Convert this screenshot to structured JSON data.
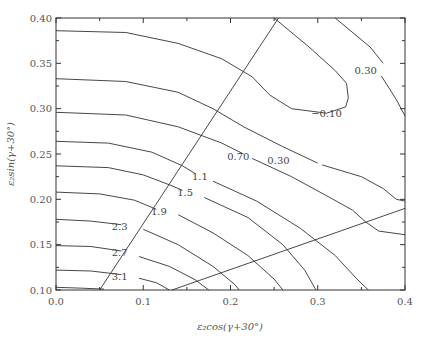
{
  "chart_data": {
    "type": "contour",
    "title": "",
    "xlabel": "ε₂cos(γ+30°)",
    "ylabel": "ε₂sin(γ+30°)",
    "xlim": [
      0.0,
      0.4
    ],
    "ylim": [
      0.1,
      0.4
    ],
    "xticks": [
      0.0,
      0.1,
      0.2,
      0.3,
      0.4
    ],
    "xtick_labels": [
      "0.0",
      "0.1",
      "0.2",
      "0.3",
      "0.4"
    ],
    "yticks": [
      0.1,
      0.15,
      0.2,
      0.25,
      0.3,
      0.35,
      0.4
    ],
    "ytick_labels": [
      "0.10",
      "0.15",
      "0.20",
      "0.25",
      "0.30",
      "0.35",
      "0.40"
    ],
    "grid": false,
    "contours": [
      {
        "level": "-0.10",
        "points": [
          [
            0.0,
            0.386
          ],
          [
            0.08,
            0.384
          ],
          [
            0.14,
            0.372
          ],
          [
            0.19,
            0.355
          ],
          [
            0.225,
            0.335
          ],
          [
            0.245,
            0.315
          ],
          [
            0.27,
            0.3
          ],
          [
            0.31,
            0.295
          ]
        ]
      },
      {
        "level": "-0.10b",
        "points": [
          [
            0.25,
            0.4
          ],
          [
            0.29,
            0.368
          ],
          [
            0.32,
            0.342
          ],
          [
            0.333,
            0.328
          ],
          [
            0.335,
            0.312
          ],
          [
            0.332,
            0.302
          ],
          [
            0.31,
            0.295
          ]
        ]
      },
      {
        "level": "0.30",
        "points": [
          [
            0.0,
            0.333
          ],
          [
            0.08,
            0.33
          ],
          [
            0.14,
            0.318
          ],
          [
            0.18,
            0.3
          ],
          [
            0.215,
            0.28
          ],
          [
            0.26,
            0.258
          ],
          [
            0.3,
            0.24
          ]
        ]
      },
      {
        "level": "0.30b",
        "points": [
          [
            0.305,
            0.238
          ],
          [
            0.35,
            0.225
          ],
          [
            0.375,
            0.212
          ],
          [
            0.39,
            0.2
          ],
          [
            0.4,
            0.198
          ]
        ]
      },
      {
        "level": "0.30c",
        "points": [
          [
            0.32,
            0.4
          ],
          [
            0.36,
            0.368
          ],
          [
            0.375,
            0.35
          ]
        ]
      },
      {
        "level": "0.30d",
        "points": [
          [
            0.373,
            0.336
          ],
          [
            0.39,
            0.31
          ],
          [
            0.4,
            0.292
          ]
        ]
      },
      {
        "level": "0.70",
        "points": [
          [
            0.0,
            0.296
          ],
          [
            0.08,
            0.293
          ],
          [
            0.14,
            0.28
          ],
          [
            0.19,
            0.262
          ],
          [
            0.215,
            0.25
          ]
        ]
      },
      {
        "level": "0.70b",
        "points": [
          [
            0.225,
            0.245
          ],
          [
            0.27,
            0.225
          ],
          [
            0.31,
            0.204
          ],
          [
            0.34,
            0.188
          ],
          [
            0.355,
            0.175
          ],
          [
            0.37,
            0.165
          ],
          [
            0.4,
            0.161
          ]
        ]
      },
      {
        "level": "1.1",
        "points": [
          [
            0.0,
            0.264
          ],
          [
            0.06,
            0.262
          ],
          [
            0.11,
            0.252
          ],
          [
            0.145,
            0.237
          ],
          [
            0.16,
            0.228
          ]
        ]
      },
      {
        "level": "1.1b",
        "points": [
          [
            0.18,
            0.22
          ],
          [
            0.23,
            0.198
          ],
          [
            0.28,
            0.168
          ],
          [
            0.32,
            0.138
          ],
          [
            0.345,
            0.112
          ],
          [
            0.358,
            0.1
          ]
        ]
      },
      {
        "level": "1.5",
        "points": [
          [
            0.0,
            0.237
          ],
          [
            0.06,
            0.235
          ],
          [
            0.1,
            0.227
          ],
          [
            0.13,
            0.216
          ],
          [
            0.145,
            0.21
          ]
        ]
      },
      {
        "level": "1.5b",
        "points": [
          [
            0.17,
            0.202
          ],
          [
            0.22,
            0.18
          ],
          [
            0.26,
            0.15
          ],
          [
            0.285,
            0.122
          ],
          [
            0.298,
            0.1
          ]
        ]
      },
      {
        "level": "1.9",
        "points": [
          [
            0.0,
            0.208
          ],
          [
            0.05,
            0.206
          ],
          [
            0.09,
            0.199
          ],
          [
            0.11,
            0.191
          ],
          [
            0.115,
            0.189
          ]
        ]
      },
      {
        "level": "1.9b",
        "points": [
          [
            0.14,
            0.183
          ],
          [
            0.18,
            0.163
          ],
          [
            0.22,
            0.138
          ],
          [
            0.25,
            0.112
          ],
          [
            0.26,
            0.1
          ]
        ]
      },
      {
        "level": "2.3",
        "points": [
          [
            0.0,
            0.178
          ],
          [
            0.04,
            0.176
          ],
          [
            0.075,
            0.172
          ]
        ]
      },
      {
        "level": "2.3b",
        "points": [
          [
            0.1,
            0.167
          ],
          [
            0.14,
            0.15
          ],
          [
            0.18,
            0.126
          ],
          [
            0.205,
            0.106
          ],
          [
            0.21,
            0.1
          ]
        ]
      },
      {
        "level": "2.7",
        "points": [
          [
            0.0,
            0.149
          ],
          [
            0.04,
            0.148
          ],
          [
            0.075,
            0.143
          ]
        ]
      },
      {
        "level": "2.7b",
        "points": [
          [
            0.095,
            0.137
          ],
          [
            0.13,
            0.126
          ],
          [
            0.16,
            0.111
          ],
          [
            0.175,
            0.1
          ]
        ]
      },
      {
        "level": "3.1",
        "points": [
          [
            0.0,
            0.122
          ],
          [
            0.04,
            0.121
          ],
          [
            0.075,
            0.117
          ]
        ]
      },
      {
        "level": "3.1b",
        "points": [
          [
            0.095,
            0.113
          ],
          [
            0.115,
            0.108
          ],
          [
            0.13,
            0.1
          ]
        ]
      },
      {
        "level": "3.5",
        "points": [
          [
            0.0,
            0.103
          ],
          [
            0.03,
            0.102
          ],
          [
            0.055,
            0.101
          ]
        ]
      }
    ],
    "boundary_lines": [
      {
        "name": "boundary-line-1",
        "points": [
          [
            0.05,
            0.1
          ],
          [
            0.255,
            0.4
          ]
        ]
      },
      {
        "name": "boundary-line-2",
        "points": [
          [
            0.133,
            0.1
          ],
          [
            0.4,
            0.19
          ]
        ]
      }
    ],
    "annotations": [
      {
        "text": "−0.10",
        "x": 0.31,
        "y": 0.295
      },
      {
        "text": "0.30",
        "x": 0.355,
        "y": 0.342
      },
      {
        "text": "0.30",
        "x": 0.255,
        "y": 0.243
      },
      {
        "text": "0.70",
        "x": 0.209,
        "y": 0.247
      },
      {
        "text": "1.1",
        "x": 0.165,
        "y": 0.225
      },
      {
        "text": "1.5",
        "x": 0.148,
        "y": 0.207
      },
      {
        "text": "1.9",
        "x": 0.118,
        "y": 0.187
      },
      {
        "text": "2.3",
        "x": 0.073,
        "y": 0.17
      },
      {
        "text": "2.7",
        "x": 0.073,
        "y": 0.141
      },
      {
        "text": "3.1",
        "x": 0.073,
        "y": 0.115
      }
    ]
  }
}
